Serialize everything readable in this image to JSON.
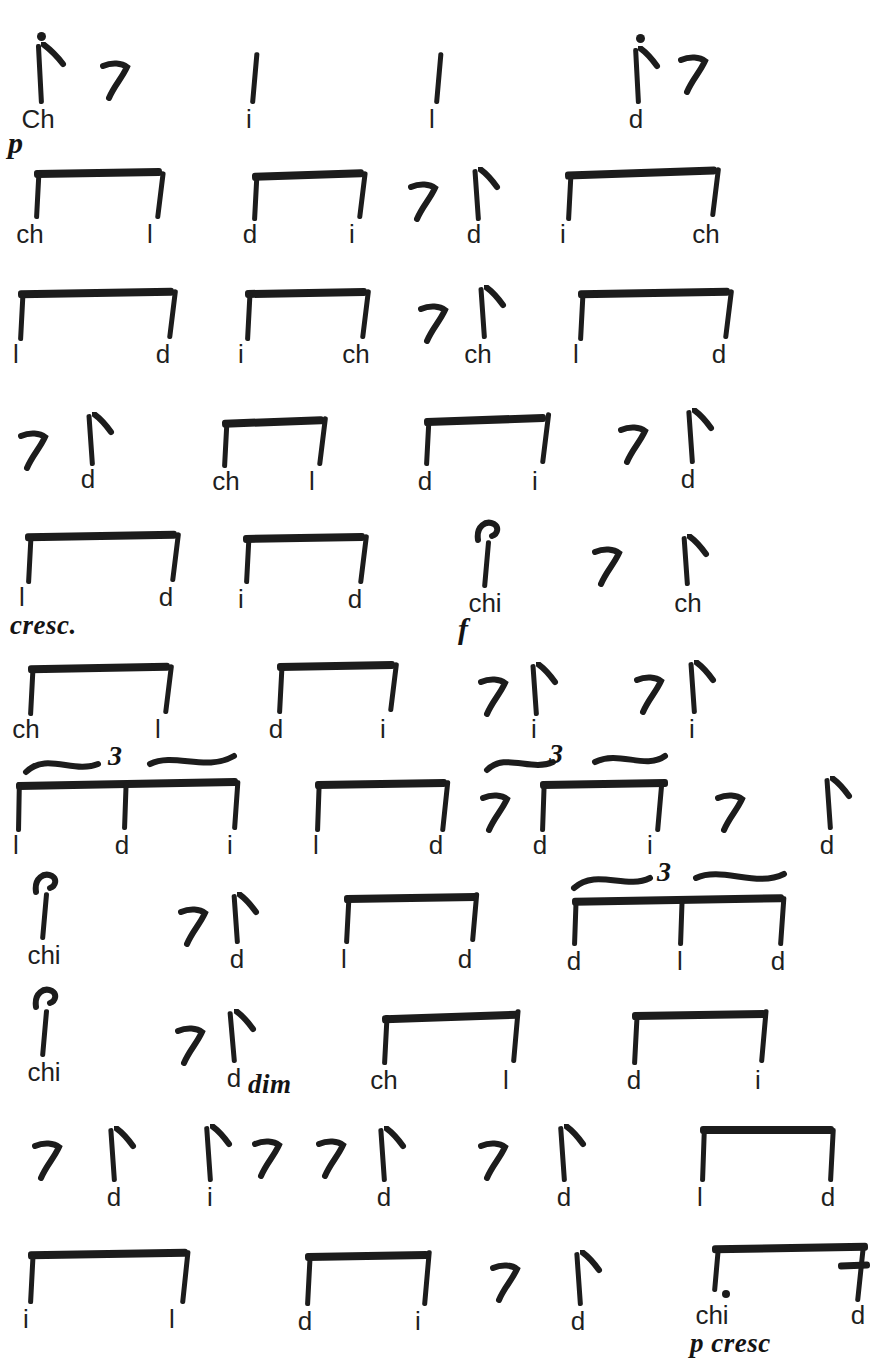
{
  "page": {
    "title_visible": false,
    "ink_color": "#1c1c1c",
    "paper_color": "#ffffff",
    "text_color": "#1f1f1f"
  },
  "notation": {
    "kind": "handwritten-rhythm-syllables",
    "syllable_set": [
      "Ch",
      "ch",
      "chi",
      "l",
      "d",
      "i"
    ],
    "dynamics_used": [
      "p",
      "cresc.",
      "f",
      "dim",
      "p cresc"
    ]
  },
  "rows": [
    {
      "index": 1,
      "events": [
        {
          "type": "note",
          "syllable": "Ch",
          "articulation": "staccato",
          "value": "eighth"
        },
        {
          "type": "rest",
          "syllable": "",
          "value": "eighth"
        },
        {
          "type": "note",
          "syllable": "i",
          "value": "quarter"
        },
        {
          "type": "note",
          "syllable": "l",
          "value": "quarter"
        },
        {
          "type": "note",
          "syllable": "d",
          "articulation": "staccato",
          "value": "eighth"
        },
        {
          "type": "rest",
          "syllable": "",
          "value": "eighth"
        }
      ],
      "dynamics": [
        {
          "text": "p",
          "x": 8,
          "y": 120
        }
      ]
    },
    {
      "index": 2,
      "events": [
        {
          "type": "beamed",
          "syllables": [
            "ch",
            "l"
          ],
          "value": "eighth"
        },
        {
          "type": "beamed",
          "syllables": [
            "d",
            "i"
          ],
          "value": "eighth"
        },
        {
          "type": "rest",
          "syllable": "",
          "value": "eighth"
        },
        {
          "type": "note",
          "syllable": "d",
          "value": "eighth"
        },
        {
          "type": "beamed",
          "syllables": [
            "i",
            "ch"
          ],
          "value": "eighth"
        }
      ],
      "dynamics": []
    },
    {
      "index": 3,
      "events": [
        {
          "type": "beamed",
          "syllables": [
            "l",
            "d"
          ],
          "value": "eighth"
        },
        {
          "type": "beamed",
          "syllables": [
            "i",
            "ch"
          ],
          "value": "eighth"
        },
        {
          "type": "rest",
          "syllable": "",
          "value": "eighth"
        },
        {
          "type": "note",
          "syllable": "ch",
          "value": "eighth"
        },
        {
          "type": "beamed",
          "syllables": [
            "l",
            "d"
          ],
          "value": "eighth"
        }
      ],
      "dynamics": []
    },
    {
      "index": 4,
      "events": [
        {
          "type": "rest",
          "syllable": "",
          "value": "eighth"
        },
        {
          "type": "note",
          "syllable": "d",
          "value": "eighth"
        },
        {
          "type": "beamed",
          "syllables": [
            "ch",
            "l"
          ],
          "value": "eighth"
        },
        {
          "type": "beamed",
          "syllables": [
            "d",
            "i"
          ],
          "value": "eighth"
        },
        {
          "type": "rest",
          "syllable": "",
          "value": "eighth"
        },
        {
          "type": "note",
          "syllable": "d",
          "value": "eighth"
        }
      ],
      "dynamics": []
    },
    {
      "index": 5,
      "events": [
        {
          "type": "beamed",
          "syllables": [
            "l",
            "d"
          ],
          "value": "eighth"
        },
        {
          "type": "beamed",
          "syllables": [
            "i",
            "d"
          ],
          "value": "eighth"
        },
        {
          "type": "note",
          "syllable": "chi",
          "articulation": "accent",
          "value": "quarter"
        },
        {
          "type": "rest",
          "syllable": "",
          "value": "eighth"
        },
        {
          "type": "note",
          "syllable": "ch",
          "value": "eighth"
        }
      ],
      "dynamics": [
        {
          "text": "cresc.",
          "x": 8,
          "y": 100
        },
        {
          "text": "f",
          "x": 462,
          "y": 104
        }
      ]
    },
    {
      "index": 6,
      "events": [
        {
          "type": "beamed",
          "syllables": [
            "ch",
            "l"
          ],
          "value": "eighth"
        },
        {
          "type": "beamed",
          "syllables": [
            "d",
            "i"
          ],
          "value": "eighth"
        },
        {
          "type": "rest",
          "syllable": "",
          "value": "eighth"
        },
        {
          "type": "note",
          "syllable": "i",
          "value": "eighth"
        },
        {
          "type": "rest",
          "syllable": "",
          "value": "eighth"
        },
        {
          "type": "note",
          "syllable": "i",
          "value": "eighth"
        }
      ],
      "dynamics": []
    },
    {
      "index": 7,
      "events": [
        {
          "type": "triplet",
          "syllables": [
            "l",
            "d",
            "i"
          ],
          "number": "3",
          "value": "eighth"
        },
        {
          "type": "beamed",
          "syllables": [
            "l",
            "d"
          ],
          "value": "eighth"
        },
        {
          "type": "rest",
          "syllable": "",
          "value": "eighth"
        },
        {
          "type": "triplet",
          "syllables": [
            "d",
            "i"
          ],
          "number": "3",
          "value": "eighth"
        },
        {
          "type": "rest",
          "syllable": "",
          "value": "eighth"
        },
        {
          "type": "note",
          "syllable": "d",
          "value": "eighth"
        }
      ],
      "dynamics": []
    },
    {
      "index": 8,
      "events": [
        {
          "type": "note",
          "syllable": "chi",
          "articulation": "accent",
          "value": "quarter"
        },
        {
          "type": "rest",
          "syllable": "",
          "value": "eighth"
        },
        {
          "type": "note",
          "syllable": "d",
          "value": "eighth"
        },
        {
          "type": "beamed",
          "syllables": [
            "l",
            "d"
          ],
          "value": "eighth"
        },
        {
          "type": "triplet",
          "syllables": [
            "d",
            "l",
            "d"
          ],
          "number": "3",
          "value": "eighth"
        }
      ],
      "dynamics": []
    },
    {
      "index": 9,
      "events": [
        {
          "type": "note",
          "syllable": "chi",
          "articulation": "accent",
          "value": "quarter"
        },
        {
          "type": "rest",
          "syllable": "",
          "value": "eighth"
        },
        {
          "type": "note",
          "syllable": "d",
          "value": "eighth"
        },
        {
          "type": "beamed",
          "syllables": [
            "ch",
            "l"
          ],
          "value": "eighth"
        },
        {
          "type": "beamed",
          "syllables": [
            "d",
            "i"
          ],
          "value": "eighth"
        }
      ],
      "dynamics": [
        {
          "text": "dim",
          "x": 248,
          "y": 98
        }
      ]
    },
    {
      "index": 10,
      "events": [
        {
          "type": "rest",
          "syllable": "",
          "value": "eighth"
        },
        {
          "type": "note",
          "syllable": "d",
          "value": "eighth"
        },
        {
          "type": "note",
          "syllable": "i",
          "value": "eighth"
        },
        {
          "type": "rest",
          "syllable": "",
          "value": "eighth"
        },
        {
          "type": "rest",
          "syllable": "",
          "value": "eighth"
        },
        {
          "type": "note",
          "syllable": "d",
          "value": "eighth"
        },
        {
          "type": "rest",
          "syllable": "",
          "value": "eighth"
        },
        {
          "type": "note",
          "syllable": "d",
          "value": "eighth"
        },
        {
          "type": "beamed",
          "syllables": [
            "l",
            "d"
          ],
          "value": "eighth"
        }
      ],
      "dynamics": []
    },
    {
      "index": 11,
      "events": [
        {
          "type": "beamed",
          "syllables": [
            "i",
            "l"
          ],
          "value": "eighth"
        },
        {
          "type": "beamed",
          "syllables": [
            "d",
            "i"
          ],
          "value": "eighth"
        },
        {
          "type": "rest",
          "syllable": "",
          "value": "eighth"
        },
        {
          "type": "note",
          "syllable": "d",
          "value": "eighth"
        },
        {
          "type": "dotted-beamed",
          "syllables": [
            "chi",
            "d"
          ],
          "value": "dotted-eighth-sixteenth"
        }
      ],
      "dynamics": [
        {
          "text": "p cresc",
          "x": 690,
          "y": 105
        }
      ]
    }
  ],
  "labels": {
    "r1": [
      "Ch",
      "i",
      "l",
      "d"
    ],
    "r2": [
      "ch",
      "l",
      "d",
      "i",
      "d",
      "i",
      "ch"
    ],
    "r3": [
      "l",
      "d",
      "i",
      "ch",
      "ch",
      "l",
      "d"
    ],
    "r4": [
      "d",
      "ch",
      "l",
      "d",
      "i",
      "d"
    ],
    "r5": [
      "l",
      "d",
      "i",
      "d",
      "chi",
      "ch"
    ],
    "r6": [
      "ch",
      "l",
      "d",
      "i",
      "i",
      "i"
    ],
    "r7": [
      "l",
      "d",
      "i",
      "l",
      "d",
      "d",
      "i",
      "d"
    ],
    "r8": [
      "chi",
      "d",
      "l",
      "d",
      "d",
      "l",
      "d"
    ],
    "r9": [
      "chi",
      "d",
      "ch",
      "l",
      "d",
      "i"
    ],
    "r10": [
      "d",
      "i",
      "d",
      "d",
      "l",
      "d"
    ],
    "r11": [
      "i",
      "l",
      "d",
      "i",
      "d",
      "chi",
      "d"
    ],
    "dyn_p": "p",
    "dyn_cresc": "cresc.",
    "dyn_f": "f",
    "dyn_dim": "dim",
    "dyn_pcresc": "p cresc",
    "trip3": "3"
  }
}
